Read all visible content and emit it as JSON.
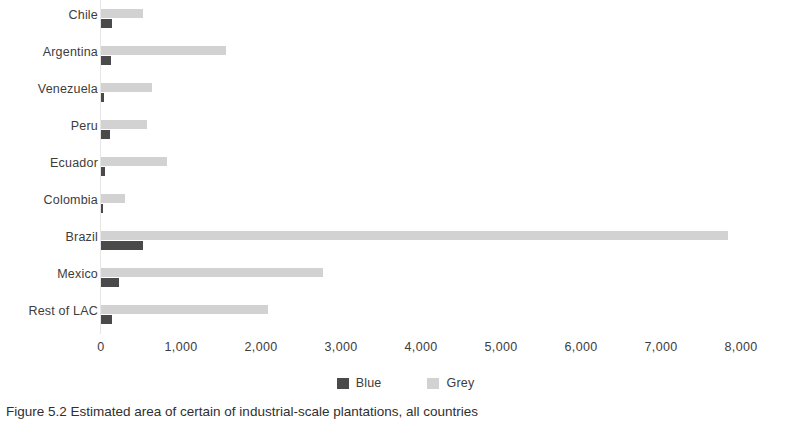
{
  "chart_data": {
    "type": "bar",
    "orientation": "horizontal",
    "title": "",
    "xlabel": "",
    "ylabel": "",
    "xlim": [
      0,
      8000
    ],
    "xticks": [
      "0",
      "1,000",
      "2,000",
      "3,000",
      "4,000",
      "5,000",
      "6,000",
      "7,000",
      "8,000"
    ],
    "grid": false,
    "legend_position": "bottom-center",
    "categories": [
      "Chile",
      "Argentina",
      "Venezuela",
      "Peru",
      "Ecuador",
      "Colombia",
      "Brazil",
      "Mexico",
      "Rest of LAC"
    ],
    "series": [
      {
        "name": "Blue",
        "color": "#4a4a4a",
        "values": [
          140,
          130,
          40,
          110,
          45,
          30,
          525,
          225,
          140
        ]
      },
      {
        "name": "Grey",
        "color": "#d2d2d2",
        "values": [
          530,
          1560,
          635,
          575,
          830,
          300,
          7830,
          2770,
          2085
        ]
      }
    ]
  },
  "legend": {
    "items": [
      {
        "label": "Blue",
        "swatch": "blue"
      },
      {
        "label": "Grey",
        "swatch": "grey"
      }
    ]
  },
  "caption": {
    "figure_number": "Figure 5.2",
    "text": "Figure 5.2  Estimated area of certain of industrial-scale plantations, all countries"
  }
}
